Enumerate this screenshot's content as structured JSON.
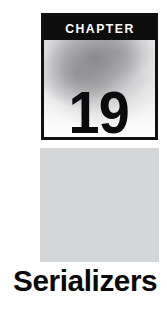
{
  "page": {
    "background_color": "#ffffff",
    "width": 167,
    "height": 313
  },
  "chapter_marker": {
    "band_label": "CHAPTER",
    "band_background_color": "#0d0d0d",
    "band_text_color": "#ffffff",
    "number": "19",
    "number_color": "#0b0b0b",
    "border_color": "#111111",
    "fill_description": "soft gray cloud gradient"
  },
  "gray_panel": {
    "color": "#d5d6d8"
  },
  "chapter_title": {
    "text": "Serializers",
    "color": "#0a0a0a"
  }
}
